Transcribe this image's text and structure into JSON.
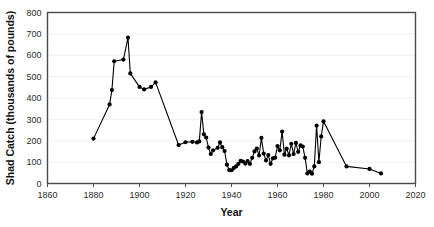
{
  "chart_data": {
    "type": "line",
    "title": "",
    "xlabel": "Year",
    "ylabel": "Shad Catch (thousands of pounds)",
    "xlim": [
      1860,
      2020
    ],
    "ylim": [
      0,
      800
    ],
    "xticks": [
      1860,
      1880,
      1900,
      1920,
      1940,
      1960,
      1980,
      2000,
      2020
    ],
    "yticks": [
      0,
      100,
      200,
      300,
      400,
      500,
      600,
      700,
      800
    ],
    "grid": "horizontal-light",
    "legend": "none",
    "marker": "filled-circle",
    "series": [
      {
        "name": "Shad Catch",
        "x": [
          1880,
          1887,
          1888,
          1889,
          1893,
          1895,
          1896,
          1900,
          1902,
          1905,
          1907,
          1917,
          1920,
          1923,
          1925,
          1926,
          1927,
          1928,
          1929,
          1930,
          1931,
          1932,
          1934,
          1935,
          1936,
          1937,
          1938,
          1939,
          1940,
          1941,
          1942,
          1943,
          1944,
          1945,
          1946,
          1947,
          1948,
          1949,
          1950,
          1951,
          1952,
          1953,
          1954,
          1955,
          1956,
          1957,
          1958,
          1959,
          1960,
          1961,
          1962,
          1963,
          1964,
          1965,
          1966,
          1967,
          1968,
          1969,
          1970,
          1971,
          1972,
          1973,
          1974,
          1975,
          1976,
          1977,
          1978,
          1979,
          1980,
          1990,
          2000,
          2005
        ],
        "values": [
          210,
          370,
          437,
          572,
          580,
          682,
          515,
          452,
          440,
          452,
          473,
          180,
          193,
          195,
          192,
          197,
          334,
          230,
          215,
          168,
          138,
          155,
          167,
          192,
          170,
          152,
          88,
          63,
          62,
          73,
          80,
          92,
          106,
          103,
          93,
          105,
          92,
          120,
          150,
          163,
          131,
          213,
          140,
          108,
          133,
          92,
          118,
          121,
          175,
          155,
          243,
          135,
          163,
          132,
          186,
          138,
          190,
          148,
          178,
          173,
          120,
          47,
          56,
          46,
          80,
          271,
          100,
          220,
          291,
          80,
          68,
          47
        ]
      }
    ]
  },
  "axes": {
    "y_tick_labels": [
      "800",
      "700",
      "600",
      "500",
      "400",
      "300",
      "200",
      "100",
      "0"
    ],
    "x_tick_labels": [
      "1860",
      "1880",
      "1900",
      "1920",
      "1940",
      "1960",
      "1980",
      "2000",
      "2020"
    ],
    "y_axis_title": "Shad Catch (thousands of pounds)",
    "x_axis_title": "Year"
  },
  "colors": {
    "series": "#000000",
    "frame": "#4a4a4a",
    "gridline": "#e9e9e9",
    "tick_text": "#2b2b2b",
    "background": "#ffffff"
  }
}
